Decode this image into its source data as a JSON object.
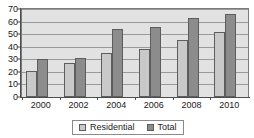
{
  "chart_data": {
    "type": "bar",
    "title": "",
    "subtitle": "",
    "xlabel": "",
    "ylabel": "",
    "categories": [
      "2000",
      "2002",
      "2004",
      "2006",
      "2008",
      "2010"
    ],
    "series": [
      {
        "name": "Residential",
        "values": [
          21,
          27,
          35,
          38,
          45,
          52
        ],
        "color": "#c9c9c9"
      },
      {
        "name": "Total",
        "values": [
          30,
          31,
          54,
          56,
          63,
          66
        ],
        "color": "#8c8c8c"
      }
    ],
    "ylim": [
      0,
      70
    ],
    "ytick_step": 10,
    "yticks": [
      70,
      60,
      50,
      40,
      30,
      20,
      10,
      0
    ],
    "grid": true,
    "legend_position": "bottom",
    "plot_background": "#e2e2e2",
    "frame_color": "#7a7a7a"
  },
  "legend": {
    "items": [
      {
        "label": "Residential"
      },
      {
        "label": "Total"
      }
    ]
  }
}
